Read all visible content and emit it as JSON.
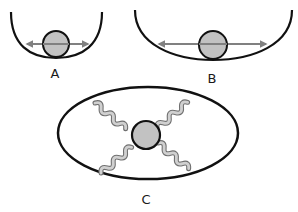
{
  "diagram": {
    "panels": [
      {
        "id": "A",
        "label": "A",
        "description": "narrow steep well with ball and double-headed arrow"
      },
      {
        "id": "B",
        "label": "B",
        "description": "wide shallow well with ball and longer double-headed arrow"
      },
      {
        "id": "C",
        "label": "C",
        "description": "ball suspended by four springs inside an ellipse"
      }
    ],
    "colors": {
      "outline": "#111111",
      "ball_fill": "#c2c2c2",
      "arrow": "#808080",
      "spring_fill": "#d0d0d0",
      "spring_stroke": "#707070"
    }
  }
}
